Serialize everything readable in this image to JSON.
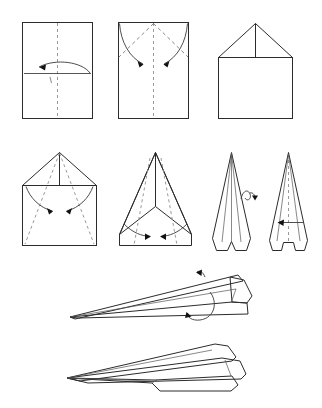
{
  "document": {
    "title": "Paper Airplane Folding Instructions",
    "description": "Ten-step line diagram showing how to fold a sheet of paper into a dart paper airplane",
    "background_color": "#ffffff",
    "line_color": "#2b2b2b",
    "fold_line_color": "#8d8d8d",
    "arrow_color": "#111111"
  },
  "steps": [
    {
      "id": 1,
      "name": "fold-sheet-in-half-lengthwise",
      "label": "Step 1",
      "row": 1,
      "column": 1,
      "shape": "portrait rectangle",
      "fold_lines": [
        "vertical center crease"
      ],
      "arrows": [
        "curved arrow right to left"
      ]
    },
    {
      "id": 2,
      "name": "fold-top-corners-to-center",
      "label": "Step 2",
      "row": 1,
      "column": 2,
      "shape": "portrait rectangle with diagonal creases",
      "fold_lines": [
        "vertical center crease",
        "diagonal crease left",
        "diagonal crease right"
      ],
      "arrows": [
        "curved arrow inward left",
        "curved arrow inward right"
      ]
    },
    {
      "id": 3,
      "name": "house-shape-result",
      "label": "Step 3",
      "row": 1,
      "column": 3,
      "shape": "triangle over square (house)",
      "fold_lines": [
        "vertical center line in triangle"
      ],
      "arrows": []
    },
    {
      "id": 4,
      "name": "fold-angled-edges-to-center",
      "label": "Step 4",
      "row": 2,
      "column": 1,
      "shape": "house shape with diagonal creases to bottom corners",
      "fold_lines": [
        "vertical center line",
        "diagonal crease left",
        "diagonal crease right"
      ],
      "arrows": [
        "curved arrow inward left",
        "curved arrow inward right"
      ]
    },
    {
      "id": 5,
      "name": "fold-point-flaps-inward",
      "label": "Step 5",
      "row": 2,
      "column": 2,
      "shape": "tall triangle with side wing flaps",
      "fold_lines": [
        "vertical center line",
        "diagonal crease left",
        "diagonal crease right"
      ],
      "arrows": [
        "arrow pointing right at center",
        "arrow pointing left at center"
      ]
    },
    {
      "id": 6,
      "name": "dart-with-notch",
      "label": "Step 6",
      "row": 2,
      "column": 3,
      "shape": "narrow dart with bottom notch",
      "fold_lines": [
        "vertical center line"
      ],
      "arrows": [
        "turn-over loop arrow"
      ]
    },
    {
      "id": 7,
      "name": "fold-in-half-along-center",
      "label": "Step 7",
      "row": 2,
      "column": 4,
      "shape": "narrow triangle with bottom tabs",
      "fold_lines": [
        "vertical center crease"
      ],
      "arrows": [
        "horizontal arrow pointing left"
      ]
    },
    {
      "id": 8,
      "name": "fold-down-wings-side-view",
      "label": "Step 8",
      "row": 3,
      "column": 1,
      "shape": "side profile of folded plane body",
      "fold_lines": [],
      "arrows": [
        "curved arrow over top wing",
        "curved arrow under body"
      ]
    },
    {
      "id": 9,
      "name": "finished-paper-airplane",
      "label": "Step 9",
      "row": 4,
      "column": 1,
      "shape": "completed dart airplane in perspective view",
      "fold_lines": [],
      "arrows": []
    }
  ]
}
